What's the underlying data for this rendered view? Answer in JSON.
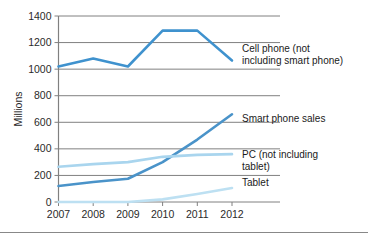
{
  "chart_data": {
    "type": "line",
    "title": "",
    "xlabel": "",
    "ylabel": "Millions",
    "categories": [
      "2007",
      "2008",
      "2009",
      "2010",
      "2011",
      "2012"
    ],
    "x": [
      2007,
      2008,
      2009,
      2010,
      2011,
      2012
    ],
    "ylim": [
      0,
      1400
    ],
    "yticks": [
      0,
      200,
      400,
      600,
      800,
      1000,
      1200,
      1400
    ],
    "ytick_labels": [
      "0",
      "200",
      "400",
      "600",
      "800",
      "1000",
      "1200",
      "1400"
    ],
    "grid": true,
    "legend_position": "inline-right",
    "series": [
      {
        "name": "Cell phone (not including smart phone)",
        "label_lines": [
          "Cell phone (not",
          "including smart phone)"
        ],
        "color": "#3F92CE",
        "width": 2.6,
        "values": [
          1020,
          1080,
          1020,
          1290,
          1290,
          1065
        ]
      },
      {
        "name": "Smart phone sales",
        "label_lines": [
          "Smart phone sales"
        ],
        "color": "#4A93C9",
        "width": 2.6,
        "values": [
          120,
          150,
          175,
          300,
          470,
          660
        ]
      },
      {
        "name": "PC (not including tablet)",
        "label_lines": [
          "PC (not including",
          "tablet)"
        ],
        "color": "#A9D5EE",
        "width": 2.6,
        "values": [
          265,
          285,
          300,
          340,
          355,
          360
        ]
      },
      {
        "name": "Tablet",
        "label_lines": [
          "Tablet"
        ],
        "color": "#BDE0F2",
        "width": 2.6,
        "values": [
          0,
          0,
          0,
          20,
          60,
          105
        ]
      }
    ]
  },
  "axis": {
    "y_title": "Millions"
  },
  "colors": {
    "grid": "#808080",
    "axis": "#808080",
    "text": "#2a2a2a",
    "background": "#ffffff"
  }
}
